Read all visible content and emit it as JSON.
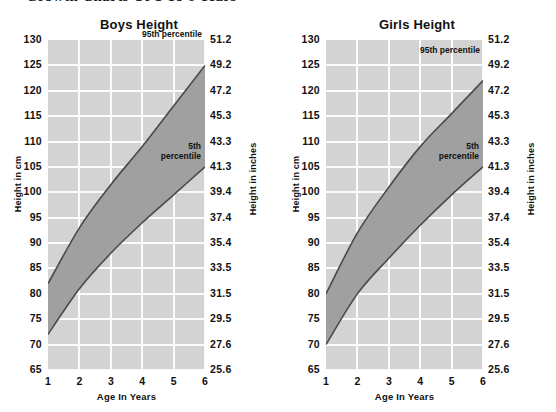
{
  "page": {
    "heading": "Growth Charts Of 1 To 6 Years"
  },
  "axis": {
    "y_left_title": "Height in cm",
    "y_right_title": "Height in inches",
    "x_title": "Age In Years",
    "y_left_ticks": [
      "130",
      "125",
      "120",
      "115",
      "110",
      "105",
      "100",
      "95",
      "90",
      "85",
      "80",
      "75",
      "70",
      "65"
    ],
    "y_right_ticks": [
      "51.2",
      "49.2",
      "47.2",
      "45.3",
      "43.3",
      "41.3",
      "39.4",
      "37.4",
      "35.4",
      "33.5",
      "31.5",
      "29.5",
      "27.6",
      "25.6"
    ],
    "x_ticks": [
      "1",
      "2",
      "3",
      "4",
      "5",
      "6"
    ]
  },
  "annotations": {
    "p95": "95th percentile",
    "p5_line1": "5th",
    "p5_line2": "percentile"
  },
  "colors": {
    "plot_background": "#d3d3d3",
    "grid": "#fbfbfb",
    "band_fill": "#a0a0a0",
    "band_stroke": "#4a4a4a",
    "text": "#111111"
  },
  "chart_data": [
    {
      "type": "area",
      "title": "Boys Height",
      "xlabel": "Age In Years",
      "ylabel": "Height in cm",
      "ylabel_secondary": "Height in inches",
      "xlim": [
        1,
        6
      ],
      "ylim": [
        65,
        130
      ],
      "ylim_secondary": [
        25.6,
        51.2
      ],
      "grid": true,
      "legend": "inline-annotations",
      "x": [
        1,
        2,
        3,
        4,
        5,
        6
      ],
      "series": [
        {
          "name": "95th percentile",
          "values": [
            82,
            93,
            101.5,
            109,
            117,
            125
          ]
        },
        {
          "name": "5th percentile",
          "values": [
            72,
            81,
            88,
            94,
            99.5,
            105
          ]
        }
      ]
    },
    {
      "type": "area",
      "title": "Girls Height",
      "xlabel": "Age In Years",
      "ylabel": "Height in cm",
      "ylabel_secondary": "Height in inches",
      "xlim": [
        1,
        6
      ],
      "ylim": [
        65,
        130
      ],
      "ylim_secondary": [
        25.6,
        51.2
      ],
      "grid": true,
      "legend": "inline-annotations",
      "x": [
        1,
        2,
        3,
        4,
        5,
        6
      ],
      "series": [
        {
          "name": "95th percentile",
          "values": [
            80,
            92,
            101,
            109,
            115.5,
            122
          ]
        },
        {
          "name": "5th percentile",
          "values": [
            70,
            80,
            87,
            93.5,
            99.5,
            105
          ]
        }
      ]
    }
  ]
}
